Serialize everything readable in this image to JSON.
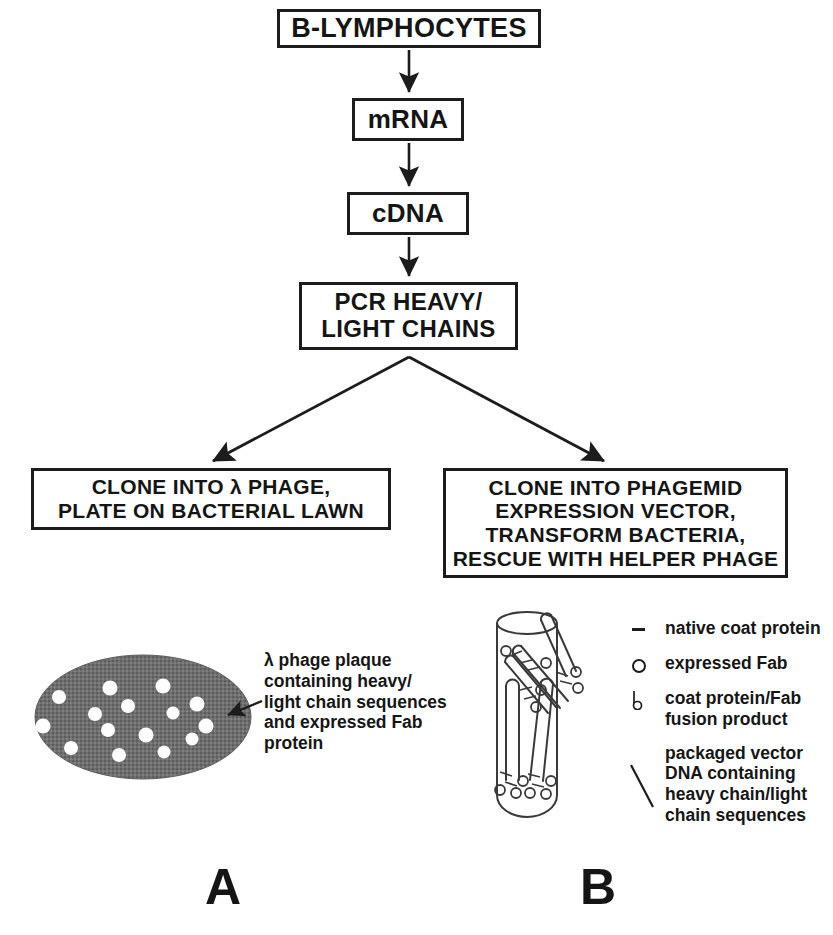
{
  "figure": {
    "panels": [
      {
        "id": "A",
        "label": "A"
      },
      {
        "id": "B",
        "label": "B"
      }
    ]
  },
  "flowchart": {
    "boxes": [
      {
        "id": "lymphocytes",
        "text": "B-LYMPHOCYTES"
      },
      {
        "id": "mrna",
        "text": "mRNA"
      },
      {
        "id": "cdna",
        "text": "cDNA"
      },
      {
        "id": "pcr",
        "text": "PCR HEAVY/\nLIGHT CHAINS"
      },
      {
        "id": "lambda",
        "text": "CLONE INTO λ PHAGE,\nPLATE ON BACTERIAL LAWN"
      },
      {
        "id": "phagemid",
        "text": "CLONE INTO PHAGEMID\nEXPRESSION VECTOR,\nTRANSFORM BACTERIA,\nRESCUE WITH HELPER PHAGE"
      }
    ],
    "arrows": [
      {
        "id": "lymphocytes-to-mrna",
        "from": "lymphocytes",
        "to": "mrna"
      },
      {
        "id": "mrna-to-cdna",
        "from": "mrna",
        "to": "cdna"
      },
      {
        "id": "cdna-to-pcr",
        "from": "cdna",
        "to": "pcr"
      },
      {
        "id": "pcr-to-lambda",
        "from": "pcr",
        "to": "lambda"
      },
      {
        "id": "pcr-to-phagemid",
        "from": "pcr",
        "to": "phagemid"
      }
    ]
  },
  "panel_a": {
    "letter": "A",
    "plaque_caption": "λ phage plaque\ncontaining heavy/\nlight chain sequences\nand expressed Fab\nprotein",
    "plaque": {
      "fill_color": "#6f6f6f",
      "dot_color": "#ffffff",
      "dot_count": 15
    }
  },
  "panel_b": {
    "letter": "B",
    "legend": [
      {
        "symbol": "dash-symbol",
        "label": "native coat protein"
      },
      {
        "symbol": "circle-symbol",
        "label": "expressed Fab"
      },
      {
        "symbol": "lollipop-symbol",
        "label": "coat protein/Fab\nfusion product"
      },
      {
        "symbol": "slash-symbol",
        "label": "packaged vector\nDNA containing\nheavy chain/light\nchain sequences"
      }
    ]
  },
  "colors": {
    "ink": "#1c1c1c",
    "plaque_fill": "#6f6f6f",
    "background": "#ffffff"
  }
}
